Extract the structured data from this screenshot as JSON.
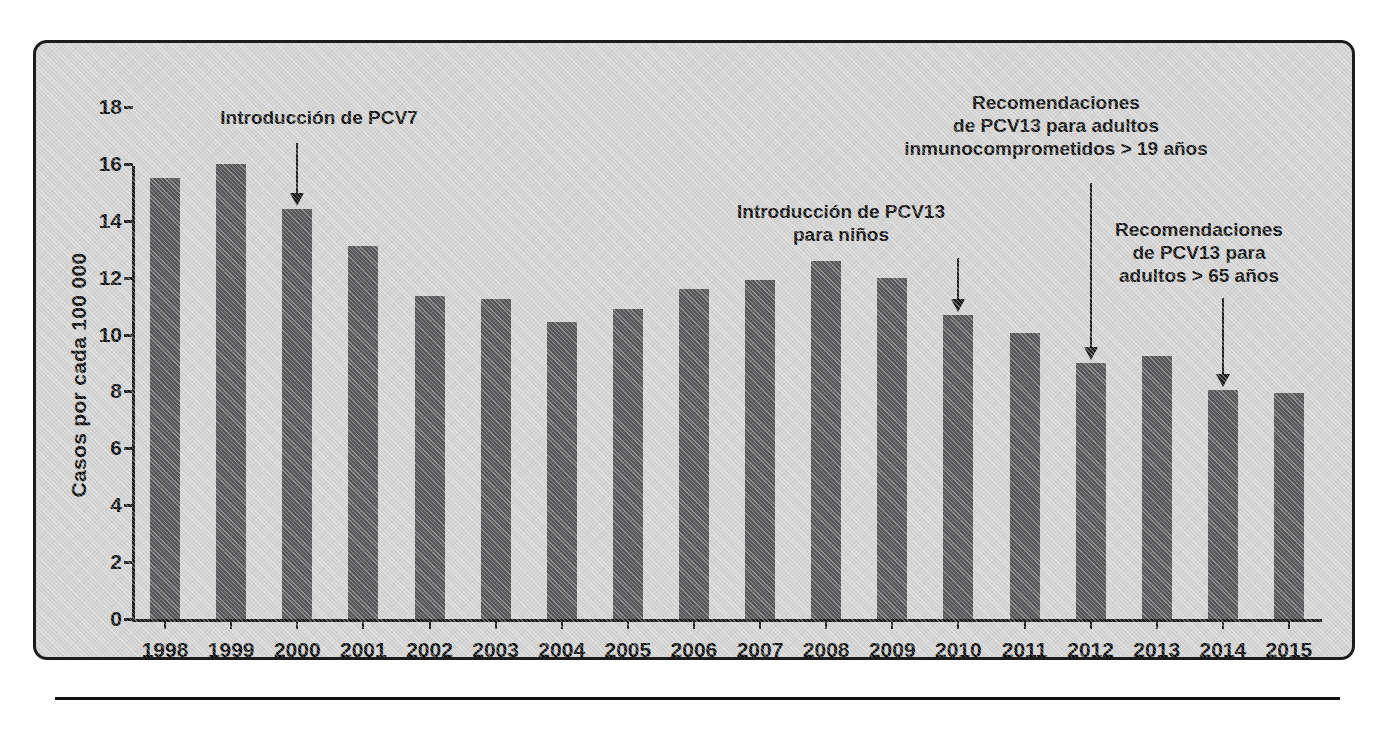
{
  "figure": {
    "panel_background": "#d3d3d3",
    "border_color": "#1c1c1c",
    "bar_color": "#58585a",
    "text_color": "#0d0d0d"
  },
  "chart_data": {
    "type": "bar",
    "title": "",
    "subtitle": "",
    "xlabel": "",
    "ylabel": "Casos por cada  100 000",
    "categories": [
      "1998",
      "1999",
      "2000",
      "2001",
      "2002",
      "2003",
      "2004",
      "2005",
      "2006",
      "2007",
      "2008",
      "2009",
      "2010",
      "2011",
      "2012",
      "2013",
      "2014",
      "2015"
    ],
    "values": [
      15.5,
      16.0,
      14.4,
      13.1,
      11.35,
      11.25,
      10.45,
      10.9,
      11.6,
      11.9,
      12.6,
      12.0,
      10.7,
      10.05,
      9.0,
      9.25,
      8.05,
      7.95
    ],
    "ylim": [
      0,
      18
    ],
    "yticks": [
      0,
      2,
      4,
      6,
      8,
      10,
      12,
      14,
      16,
      18
    ],
    "ytick_labels": [
      "0",
      "2",
      "4",
      "6",
      "8",
      "10",
      "12",
      "14",
      "16",
      "18"
    ],
    "grid": false,
    "legend": null,
    "series": [
      {
        "name": "Casos por cada 100 000",
        "values": [
          15.5,
          16.0,
          14.4,
          13.1,
          11.35,
          11.25,
          10.45,
          10.9,
          11.6,
          11.9,
          12.6,
          12.0,
          10.7,
          10.05,
          9.0,
          9.25,
          8.05,
          7.95
        ]
      }
    ],
    "annotations": [
      {
        "id": "pcv7-introduction",
        "text": "Introducción de PCV7",
        "target_category": "2000",
        "target_value": 14.4
      },
      {
        "id": "pcv13-children-introduction",
        "text": "Introducción de PCV13\npara niños",
        "target_category": "2010",
        "target_value": 10.7
      },
      {
        "id": "pcv13-immunocompromised-adults",
        "text": "Recomendaciones\nde PCV13 para adultos\ninmunocomprometidos > 19 años",
        "target_category": "2012",
        "target_value": 9.0
      },
      {
        "id": "pcv13-adults-over-65",
        "text": "Recomendaciones\nde PCV13 para\nadultos > 65 años",
        "target_category": "2014",
        "target_value": 8.05
      }
    ]
  }
}
